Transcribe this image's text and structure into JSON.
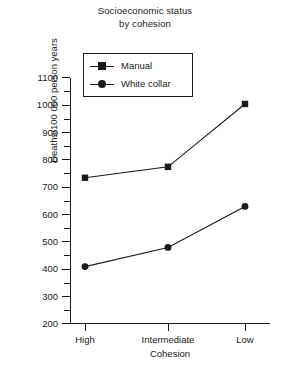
{
  "chart_data": {
    "type": "line",
    "title": "Socioeconomic status by cohesion",
    "title_lines": [
      "Socioeconomic status",
      "by cohesion"
    ],
    "xlabel": "Cohesion",
    "ylabel": "Deaths/100 000 person years",
    "categories": [
      "High",
      "Intermediate",
      "Low"
    ],
    "ylim": [
      200,
      1100
    ],
    "ytick_step": 100,
    "yticks": [
      200,
      300,
      400,
      500,
      600,
      700,
      800,
      900,
      1000,
      1100
    ],
    "ytick_labels": [
      "200",
      "300",
      "400",
      "500",
      "600",
      "700",
      "800",
      "900",
      "1000",
      "1100"
    ],
    "minor_ticks": true,
    "grid": false,
    "legend_position": "upper left inside",
    "series": [
      {
        "name": "Manual",
        "marker": "square",
        "color": "#1a1a1a",
        "values": [
          735,
          775,
          1005
        ]
      },
      {
        "name": "White collar",
        "marker": "circle",
        "color": "#1a1a1a",
        "values": [
          410,
          480,
          630
        ]
      }
    ]
  },
  "legend": {
    "items": [
      {
        "label": "Manual",
        "marker": "square"
      },
      {
        "label": "White collar",
        "marker": "circle"
      }
    ]
  }
}
